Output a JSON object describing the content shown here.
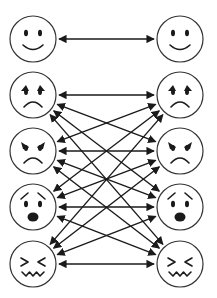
{
  "diagram": {
    "title": "",
    "colors": {
      "background": "#ffffff",
      "line": "#1a1a1a",
      "circle_stroke": "#333333"
    },
    "layout": {
      "left_x": 33,
      "right_x": 180,
      "radius": 23,
      "rows_y": [
        39,
        95,
        151,
        207,
        264
      ]
    },
    "faces": [
      {
        "id": "happy",
        "label": "happy-face",
        "row": 0
      },
      {
        "id": "sad",
        "label": "sad-face",
        "row": 1
      },
      {
        "id": "angry",
        "label": "angry-face",
        "row": 2
      },
      {
        "id": "fearful",
        "label": "fearful-face",
        "row": 3
      },
      {
        "id": "disgusted",
        "label": "disgusted-face",
        "row": 4
      }
    ],
    "columns": [
      "left",
      "right"
    ],
    "connections": [
      {
        "from": "happy",
        "to": "happy",
        "bidirectional": true
      },
      {
        "from": "sad",
        "to": "sad",
        "bidirectional": true
      },
      {
        "from": "sad",
        "to": "angry",
        "bidirectional": true
      },
      {
        "from": "sad",
        "to": "fearful",
        "bidirectional": true
      },
      {
        "from": "sad",
        "to": "disgusted",
        "bidirectional": true
      },
      {
        "from": "angry",
        "to": "sad",
        "bidirectional": true
      },
      {
        "from": "angry",
        "to": "angry",
        "bidirectional": true
      },
      {
        "from": "angry",
        "to": "fearful",
        "bidirectional": true
      },
      {
        "from": "angry",
        "to": "disgusted",
        "bidirectional": true
      },
      {
        "from": "fearful",
        "to": "sad",
        "bidirectional": true
      },
      {
        "from": "fearful",
        "to": "angry",
        "bidirectional": true
      },
      {
        "from": "fearful",
        "to": "fearful",
        "bidirectional": true
      },
      {
        "from": "fearful",
        "to": "disgusted",
        "bidirectional": true
      },
      {
        "from": "disgusted",
        "to": "sad",
        "bidirectional": true
      },
      {
        "from": "disgusted",
        "to": "angry",
        "bidirectional": true
      },
      {
        "from": "disgusted",
        "to": "fearful",
        "bidirectional": true
      },
      {
        "from": "disgusted",
        "to": "disgusted",
        "bidirectional": true
      }
    ]
  }
}
